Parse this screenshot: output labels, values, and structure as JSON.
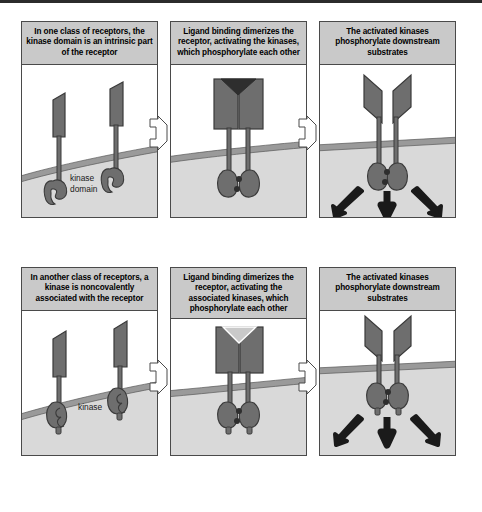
{
  "figure": {
    "colors": {
      "caption_bg": "#c9c9c9",
      "panel_border": "#4a4a4a",
      "protein_fill": "#6e6e6e",
      "protein_stroke": "#3a3a3a",
      "membrane": "#9a9a9a",
      "cytoplasm": "#d9d9d9",
      "ligand_dark": "#2e2e2e",
      "ligand_light": "#c9c9c9",
      "arrow": "#1a1a1a"
    }
  },
  "rows": [
    {
      "name": "receptor-tyrosine-kinase-row",
      "panels": [
        {
          "caption": "In one class of receptors, the kinase domain is an intrinsic part of the receptor",
          "label": "kinase\ndomain",
          "state": "unbound-monomers",
          "ligand": "none",
          "arrows": 0
        },
        {
          "caption": "Ligand binding dimerizes the receptor, activating the kinases, which phosphorylate each other",
          "label": "",
          "state": "dimerized-phosphorylated",
          "ligand": "dark-triangle",
          "arrows": 0
        },
        {
          "caption": "The activated kinases phosphorylate downstream substrates",
          "label": "",
          "state": "dimerized-signaling",
          "ligand": "open-v",
          "arrows": 3
        }
      ]
    },
    {
      "name": "receptor-associated-kinase-row",
      "panels": [
        {
          "caption": "In another class of receptors, a kinase is noncovalently associated with the receptor",
          "label": "kinase",
          "state": "unbound-monomers-assoc",
          "ligand": "none",
          "arrows": 0
        },
        {
          "caption": "Ligand binding dimerizes the receptor, activating the associated kinases, which phosphorylate each other",
          "label": "",
          "state": "dimerized-phosphorylated-assoc",
          "ligand": "light-v",
          "arrows": 0
        },
        {
          "caption": "The activated kinases phosphorylate downstream substrates",
          "label": "",
          "state": "dimerized-signaling-assoc",
          "ligand": "open-v",
          "arrows": 3
        }
      ]
    }
  ],
  "connectors": [
    {
      "name": "arrow-row1-panel1-to-panel2",
      "glyph": "chevron-right"
    },
    {
      "name": "arrow-row1-panel2-to-panel3",
      "glyph": "chevron-right"
    },
    {
      "name": "arrow-row2-panel1-to-panel2",
      "glyph": "chevron-right"
    },
    {
      "name": "arrow-row2-panel2-to-panel3",
      "glyph": "chevron-right"
    }
  ]
}
